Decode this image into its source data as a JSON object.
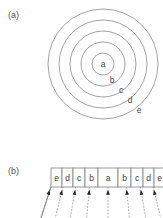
{
  "figure": {
    "panels": [
      {
        "id": "a",
        "label": "(a)",
        "type": "concentric-rings",
        "ring_labels": [
          "a",
          "b",
          "c",
          "d",
          "e"
        ],
        "center": {
          "x": 63,
          "y": 60
        },
        "radii": [
          11,
          22,
          33,
          44,
          55
        ],
        "stroke_color": "#8c8c8c",
        "label_positions": [
          {
            "text": "a",
            "x": 63,
            "y": 63
          },
          {
            "text": "b",
            "x": 72,
            "y": 79
          },
          {
            "text": "c",
            "x": 81,
            "y": 89
          },
          {
            "text": "d",
            "x": 90,
            "y": 99
          },
          {
            "text": "e",
            "x": 99,
            "y": 109
          }
        ]
      },
      {
        "id": "b",
        "label": "(b)",
        "type": "detector-array",
        "cells": [
          {
            "label": "e",
            "x": 11,
            "width": 11
          },
          {
            "label": "d",
            "x": 22,
            "width": 11
          },
          {
            "label": "c",
            "x": 33,
            "width": 12
          },
          {
            "label": "b",
            "x": 45,
            "width": 13
          },
          {
            "label": "a",
            "x": 58,
            "width": 20
          },
          {
            "label": "b",
            "x": 78,
            "width": 13
          },
          {
            "label": "c",
            "x": 91,
            "width": 12
          },
          {
            "label": "d",
            "x": 103,
            "width": 11
          },
          {
            "label": "e",
            "x": 114,
            "width": 11
          }
        ],
        "row": {
          "x": 11,
          "y": 8,
          "width": 114,
          "height": 19
        },
        "funnel": {
          "top_left_x": 11,
          "top_right_x": 125,
          "bottom_left_x": 1,
          "bottom_right_x": 135,
          "top_y": 27,
          "bottom_y": 58
        },
        "ray_count": 9,
        "ray_style": "dashed",
        "arrow_direction": "up",
        "arrow_color": "#262626"
      }
    ]
  }
}
